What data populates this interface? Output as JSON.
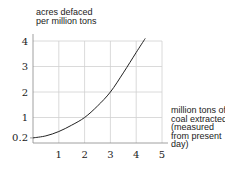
{
  "chart_data": {
    "type": "line",
    "title": "",
    "ylabel": "acres defaced per million tons",
    "ylabel_lines": [
      "acres defaced",
      "per million tons"
    ],
    "xlabel": "million tons of coal extracted (measured from present day)",
    "xlabel_lines": [
      "million tons of",
      "coal extracted",
      "(measured",
      "from present",
      "day)"
    ],
    "x_ticks": [
      "1",
      "2",
      "3",
      "4",
      "5"
    ],
    "y_ticks": [
      "0.2",
      "1",
      "2",
      "3",
      "4"
    ],
    "xlim": [
      0,
      5
    ],
    "ylim": [
      0,
      4
    ],
    "grid": true,
    "legend": null,
    "series": [
      {
        "name": "acres defaced per million tons",
        "x": [
          0,
          0.5,
          1,
          1.5,
          2,
          2.5,
          3,
          3.5,
          4,
          4.35
        ],
        "y": [
          0.2,
          0.28,
          0.45,
          0.7,
          1.0,
          1.45,
          2.0,
          2.75,
          3.55,
          4.1
        ]
      }
    ],
    "line_color": "#222222",
    "grid_color": "#d0d0d0"
  }
}
